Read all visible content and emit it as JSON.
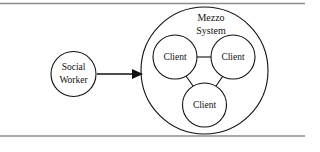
{
  "figure": {
    "kind": "systems-diagram",
    "background_color": "#ffffff",
    "stroke_color": "#111111",
    "rule_color": "#8d8d8d"
  },
  "rules": {
    "top_label": "top-divider-rule",
    "bottom_label": "bottom-divider-rule"
  },
  "actor": {
    "label_line1": "Social",
    "label_line2": "Worker"
  },
  "arrow": {
    "label": "intervention-arrow",
    "direction": "right"
  },
  "system": {
    "label_line1": "Mezzo",
    "label_line2": "System"
  },
  "clients": [
    {
      "label": "Client",
      "position": "left"
    },
    {
      "label": "Client",
      "position": "right"
    },
    {
      "label": "Client",
      "position": "bottom"
    }
  ],
  "connections": [
    {
      "from": "left",
      "to": "right"
    },
    {
      "from": "left",
      "to": "bottom"
    },
    {
      "from": "right",
      "to": "bottom"
    }
  ]
}
